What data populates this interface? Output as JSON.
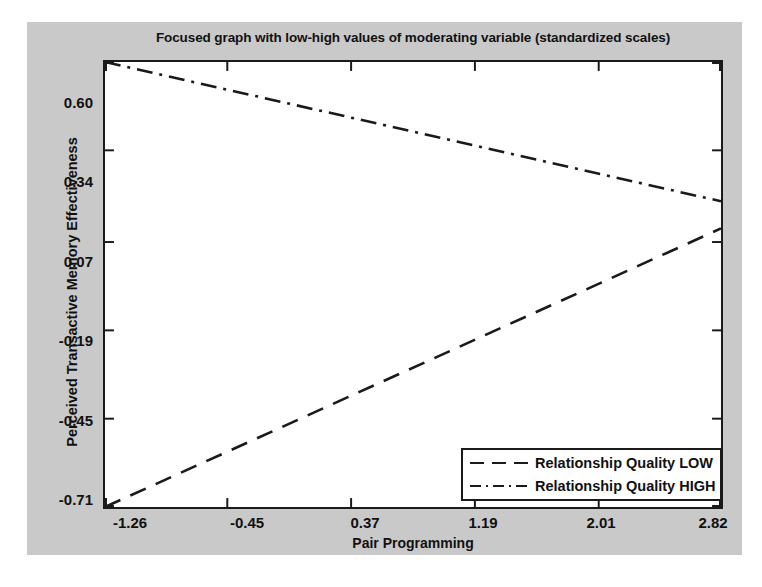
{
  "chart_data": {
    "type": "line",
    "title": "Focused graph with low-high values of moderating variable (standardized scales)",
    "xlabel": "Pair Programming",
    "ylabel": "Perceived Transactive Memory Effectiveness",
    "xtick_labels": [
      "-1.26",
      "-0.45",
      "0.37",
      "1.19",
      "2.01",
      "2.82"
    ],
    "xticks": [
      -1.26,
      -0.45,
      0.37,
      1.19,
      2.01,
      2.82
    ],
    "ytick_labels": [
      "0.60",
      "0.34",
      "0.07",
      "-0.19",
      "-0.45",
      "-0.71"
    ],
    "yticks": [
      0.6,
      0.34,
      0.07,
      -0.19,
      -0.45,
      -0.71
    ],
    "xlim": [
      -1.26,
      2.82
    ],
    "ylim": [
      -0.71,
      0.6
    ],
    "grid": false,
    "legend_position": "lower right",
    "series": [
      {
        "name": "Relationship Quality LOW",
        "style": "dashed",
        "color": "#1a1a1a",
        "x": [
          -1.26,
          2.82
        ],
        "values": [
          -0.71,
          0.11
        ]
      },
      {
        "name": "Relationship Quality HIGH",
        "style": "dash-dot",
        "color": "#1a1a1a",
        "x": [
          -1.26,
          2.82
        ],
        "values": [
          0.6,
          0.19
        ]
      }
    ]
  },
  "figure": {
    "background_color": "#c9c9c9",
    "plot_background_color": "#ffffff",
    "axis_color": "#1a1a1a"
  }
}
